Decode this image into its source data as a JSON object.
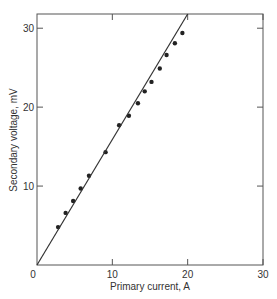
{
  "chart_data": {
    "type": "scatter",
    "title": "",
    "xlabel": "Primary current, A",
    "ylabel": "Secondary voltage, mV",
    "xlim": [
      0,
      30
    ],
    "ylim": [
      0,
      31.8
    ],
    "xticks": [
      0,
      10,
      20,
      30
    ],
    "yticks": [
      10,
      20,
      30
    ],
    "origin_label": "0",
    "grid": false,
    "legend": null,
    "series": [
      {
        "name": "measured",
        "kind": "points",
        "x": [
          2.8,
          3.8,
          4.8,
          5.8,
          6.9,
          9.1,
          10.9,
          12.2,
          13.4,
          14.3,
          15.2,
          16.3,
          17.2,
          18.3,
          19.3
        ],
        "y": [
          4.8,
          6.6,
          8.1,
          9.7,
          11.3,
          14.3,
          17.7,
          18.9,
          20.5,
          22.0,
          23.2,
          24.9,
          26.6,
          28.1,
          29.4
        ]
      },
      {
        "name": "fit",
        "kind": "line",
        "x": [
          0,
          20
        ],
        "y": [
          0,
          31.8
        ]
      }
    ]
  },
  "colors": {
    "ink": "#333333",
    "frame": "#555555"
  }
}
